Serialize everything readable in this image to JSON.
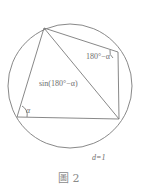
{
  "figure": {
    "caption": "圖 2",
    "labels": {
      "angle_top_right": "180°−α",
      "diagonal": "sin(180°−α)",
      "angle_left": "α",
      "diameter": "d=1"
    },
    "shapes": {
      "circle": "circumscribed circle",
      "quadrilateral": "cyclic quadrilateral with one diagonal"
    }
  }
}
